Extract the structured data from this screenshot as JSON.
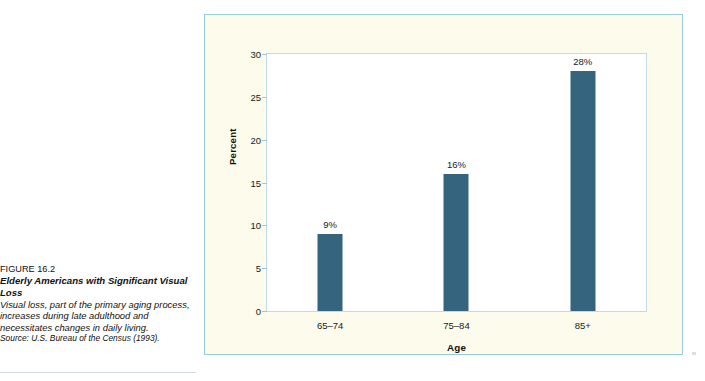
{
  "caption": {
    "figure_number": "FIGURE 16.2",
    "figure_title": "Elderly Americans with Significant Visual Loss",
    "description": "Visual loss, part of the primary aging process, increases during late adulthood and necessitates changes in daily living.",
    "source": "Source: U.S. Bureau of the Census (1993).",
    "accent_color": "#5bb8a0"
  },
  "figure": {
    "frame_background": "#fcfbec",
    "frame_border_color": "#96cfd9",
    "plot_background": "#ffffff",
    "plot_border_color": "#bfdce7",
    "bar_color": "#35657e"
  },
  "chart_data": {
    "type": "bar",
    "title": "",
    "categories": [
      "65–74",
      "75–84",
      "85+"
    ],
    "values": [
      9,
      16,
      28
    ],
    "data_labels": [
      "9%",
      "16%",
      "28%"
    ],
    "xlabel": "Age",
    "ylabel": "Percent",
    "ylim": [
      0,
      30
    ],
    "yticks": [
      0,
      5,
      10,
      15,
      20,
      25,
      30
    ],
    "ytick_labels": [
      "0",
      "5",
      "10",
      "15",
      "20",
      "25",
      "30"
    ],
    "grid": false,
    "legend": false,
    "series": [
      {
        "name": "Percent with significant visual loss",
        "values": [
          9,
          16,
          28
        ]
      }
    ]
  }
}
